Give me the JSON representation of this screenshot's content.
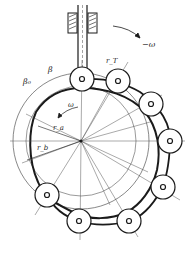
{
  "diagram": {
    "type": "cam-mechanism",
    "labels": {
      "omega_top": "−ω",
      "omega_inner": "ω",
      "beta": "β",
      "beta0": "β₀",
      "r_T": "r_T",
      "r_a": "r_a",
      "r_b": "r_b"
    },
    "colors": {
      "stroke": "#1a1a1a",
      "thin": "#555555",
      "background": "#ffffff"
    }
  }
}
